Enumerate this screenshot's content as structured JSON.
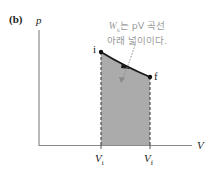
{
  "figure": {
    "panel_label": "(b)",
    "axes": {
      "y_label": "p",
      "x_label": "V"
    },
    "points": {
      "initial": {
        "label": "i",
        "x": 101,
        "y": 52
      },
      "final": {
        "label": "f",
        "x": 150,
        "y": 77
      }
    },
    "ticks": {
      "vi": "V",
      "vi_sub": "i",
      "vf": "V",
      "vf_sub": "f"
    },
    "annotation": {
      "line1_w": "W",
      "line1_sub": "s",
      "line1_rest": "는 pV 곡선",
      "line2": "아래 넓이이다."
    },
    "colors": {
      "shade": "#a9a9a9",
      "curve": "#1a1a1a",
      "axis": "#7a7a7a",
      "note": "#9a9a9a"
    }
  }
}
